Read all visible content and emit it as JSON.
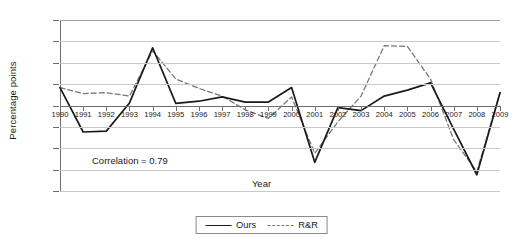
{
  "chart_data": {
    "type": "line",
    "title": "",
    "xlabel": "Year",
    "ylabel": "Percentage points",
    "ylim": [
      -2,
      2
    ],
    "yticks": [
      "2",
      "1.5",
      "1",
      "0.5",
      "0",
      "-0.5",
      "-1",
      "-1.5",
      "-2"
    ],
    "ytick_values": [
      2,
      1.5,
      1,
      0.5,
      0,
      -0.5,
      -1,
      -1.5,
      -2
    ],
    "grid": true,
    "legend_position": "bottom",
    "annotations": [
      "Correlation = 0.79"
    ],
    "categories": [
      "1990",
      "1991",
      "1992",
      "1993",
      "1994",
      "1995",
      "1996",
      "1997",
      "1998",
      "1999",
      "2000",
      "2001",
      "2002",
      "2003",
      "2004",
      "2005",
      "2006",
      "2007",
      "2008",
      "2009"
    ],
    "x": [
      1990,
      1991,
      1992,
      1993,
      1994,
      1995,
      1996,
      1997,
      1998,
      1999,
      2000,
      2001,
      2002,
      2003,
      2004,
      2005,
      2006,
      2007,
      2008,
      2009
    ],
    "series": [
      {
        "name": "Ours",
        "style": "solid",
        "color": "#1a1a1a",
        "values": [
          0.42,
          -0.62,
          -0.6,
          0.06,
          1.35,
          0.05,
          0.1,
          0.2,
          0.08,
          0.08,
          0.42,
          -1.33,
          -0.05,
          -0.12,
          0.22,
          0.36,
          0.53,
          -0.55,
          -1.62,
          0.3
        ]
      },
      {
        "name": "R&R",
        "style": "dashed",
        "color": "#777777",
        "values": [
          0.42,
          0.28,
          0.3,
          0.22,
          1.28,
          0.62,
          0.4,
          0.22,
          -0.1,
          -0.3,
          0.2,
          -1.12,
          -0.38,
          0.22,
          1.4,
          1.38,
          0.62,
          -0.8,
          -1.55,
          0.3
        ]
      }
    ]
  },
  "axis": {
    "ylabel_text": "Percentage points",
    "xlabel_text": "Year"
  },
  "legend": {
    "items": [
      {
        "label": "Ours"
      },
      {
        "label": "R&R"
      }
    ]
  },
  "annotation": {
    "correlation_text": "Correlation = 0.79"
  }
}
